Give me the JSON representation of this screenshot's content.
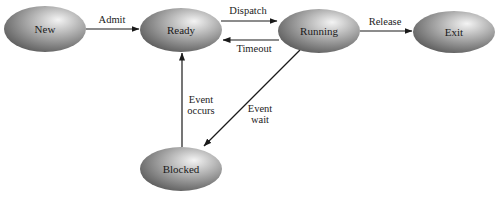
{
  "diagram": {
    "type": "state-transition",
    "states": [
      {
        "id": "new",
        "label": "New",
        "cx": 45,
        "cy": 29,
        "rx": 41,
        "ry": 23
      },
      {
        "id": "ready",
        "label": "Ready",
        "cx": 181,
        "cy": 30,
        "rx": 41,
        "ry": 22
      },
      {
        "id": "running",
        "label": "Running",
        "cx": 319,
        "cy": 31,
        "rx": 41,
        "ry": 22
      },
      {
        "id": "exit",
        "label": "Exit",
        "cx": 454,
        "cy": 32,
        "rx": 41,
        "ry": 21
      },
      {
        "id": "blocked",
        "label": "Blocked",
        "cx": 181,
        "cy": 169,
        "rx": 41,
        "ry": 22
      }
    ],
    "transitions": [
      {
        "id": "admit",
        "from": "New",
        "to": "Ready",
        "label": "Admit"
      },
      {
        "id": "dispatch",
        "from": "Ready",
        "to": "Running",
        "label": "Dispatch"
      },
      {
        "id": "timeout",
        "from": "Running",
        "to": "Ready",
        "label": "Timeout"
      },
      {
        "id": "release",
        "from": "Running",
        "to": "Exit",
        "label": "Release"
      },
      {
        "id": "event-wait",
        "from": "Running",
        "to": "Blocked",
        "label_line1": "Event",
        "label_line2": "wait"
      },
      {
        "id": "event-occurs",
        "from": "Blocked",
        "to": "Ready",
        "label_line1": "Event",
        "label_line2": "occurs"
      }
    ],
    "colors": {
      "node_light": "#f2f2f2",
      "node_mid": "#a8a8a8",
      "node_dark": "#6a6a6a",
      "edge": "#1a1a1a"
    }
  }
}
